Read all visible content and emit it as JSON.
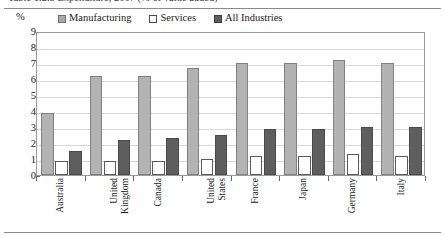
{
  "figure": {
    "caption_sliver": "Table 1.2.3   Expenditure, 2007 (% of value added)",
    "unit_label": "%"
  },
  "legend": {
    "position": "top",
    "items": [
      {
        "label": "Manufacturing",
        "swatch": "filled-light-gray-square",
        "color": "#b3b3b3"
      },
      {
        "label": "Services",
        "swatch": "hollow-white-square",
        "color": "#ffffff"
      },
      {
        "label": "All Industries",
        "swatch": "filled-dark-gray-square",
        "color": "#5e5e5e"
      }
    ]
  },
  "chart_data": {
    "type": "bar",
    "title": "",
    "subtitle": "",
    "xlabel": "",
    "ylabel": "%",
    "ylim": [
      0,
      9
    ],
    "yticks": [
      0,
      1,
      2,
      3,
      4,
      5,
      6,
      7,
      8,
      9
    ],
    "ytick_labels": [
      "0",
      "1",
      "2",
      "3",
      "4",
      "5",
      "6",
      "7",
      "8",
      "9"
    ],
    "grid": true,
    "legend_position": "top",
    "categories": [
      "Australia",
      "United Kingdom",
      "Canada",
      "United States",
      "France",
      "Japan",
      "Germany",
      "Italy"
    ],
    "category_lines": [
      [
        "Australia"
      ],
      [
        "United",
        "Kingdom"
      ],
      [
        "Canada"
      ],
      [
        "United",
        "States"
      ],
      [
        "France"
      ],
      [
        "Japan"
      ],
      [
        "Germany"
      ],
      [
        "Italy"
      ]
    ],
    "series": [
      {
        "name": "Manufacturing",
        "color": "#b3b3b3",
        "values": [
          3.9,
          6.2,
          6.2,
          6.7,
          7.0,
          7.0,
          7.2,
          7.0
        ]
      },
      {
        "name": "Services",
        "color": "#ffffff",
        "values": [
          0.9,
          0.9,
          0.9,
          1.0,
          1.2,
          1.2,
          1.3,
          1.2
        ]
      },
      {
        "name": "All Industries",
        "color": "#5e5e5e",
        "values": [
          1.5,
          2.2,
          2.3,
          2.5,
          2.9,
          2.9,
          3.0,
          3.0
        ]
      }
    ]
  }
}
